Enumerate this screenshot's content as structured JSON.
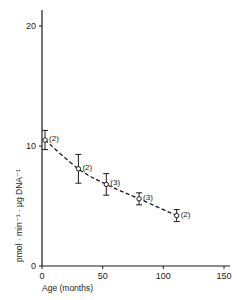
{
  "chart_data": {
    "type": "line",
    "title": "",
    "xlabel": "Age (months)",
    "ylabel": "pmol · min⁻¹ · µg DNA⁻¹",
    "xlim": [
      0,
      150
    ],
    "ylim": [
      0,
      22
    ],
    "x_ticks": [
      0,
      50,
      100,
      150
    ],
    "y_ticks": [
      0,
      10,
      20
    ],
    "grid": false,
    "legend": null,
    "line_style": "dashed",
    "series": [
      {
        "name": "activity",
        "points": [
          {
            "x": 2.5,
            "y": 10.5,
            "err": 0.8,
            "n": "(2)"
          },
          {
            "x": 30,
            "y": 8.1,
            "err": 1.2,
            "n": "(2)"
          },
          {
            "x": 53,
            "y": 6.8,
            "err": 0.9,
            "n": "(3)"
          },
          {
            "x": 80,
            "y": 5.6,
            "err": 0.5,
            "n": "(3)"
          },
          {
            "x": 111,
            "y": 4.2,
            "err": 0.5,
            "n": "(2)"
          }
        ]
      }
    ]
  },
  "labels": {
    "x_ticks": [
      "0",
      "50",
      "100",
      "150"
    ],
    "y_ticks": [
      "0",
      "10",
      "20"
    ],
    "xlabel": "Age (months)",
    "ylabel": "pmol · min⁻¹ · µg DNA⁻¹"
  }
}
